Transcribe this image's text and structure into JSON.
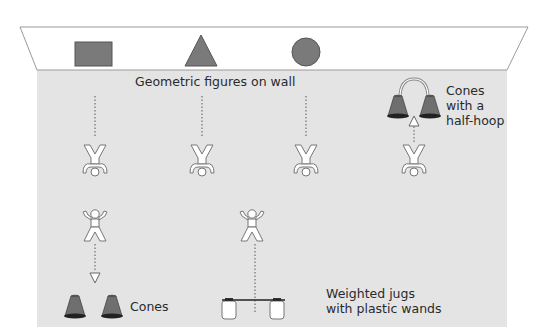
{
  "colors": {
    "floor": "#e4e4e4",
    "wall": "#ffffff",
    "shape_fill": "#7a7a7a",
    "shape_stroke": "#555555",
    "line": "#8a8a8a",
    "text": "#2a2a2a"
  },
  "wall": {
    "label": "Geometric figures on wall",
    "shapes": [
      {
        "name": "rectangle",
        "kind": "rect"
      },
      {
        "name": "triangle",
        "kind": "triangle"
      },
      {
        "name": "circle",
        "kind": "circle"
      }
    ]
  },
  "stations": {
    "cones_label": "Cones",
    "jugs_label_line1": "Weighted jugs",
    "jugs_label_line2": "with plastic wands",
    "hoop_label_line1": "Cones",
    "hoop_label_line2": "with a",
    "hoop_label_line3": "half-hoop"
  },
  "figures": [
    {
      "id": "inverted-1",
      "pose": "inverted"
    },
    {
      "id": "inverted-2",
      "pose": "inverted"
    },
    {
      "id": "inverted-3",
      "pose": "inverted"
    },
    {
      "id": "inverted-4",
      "pose": "inverted"
    },
    {
      "id": "upright-1",
      "pose": "upright"
    },
    {
      "id": "upright-2",
      "pose": "upright"
    }
  ]
}
